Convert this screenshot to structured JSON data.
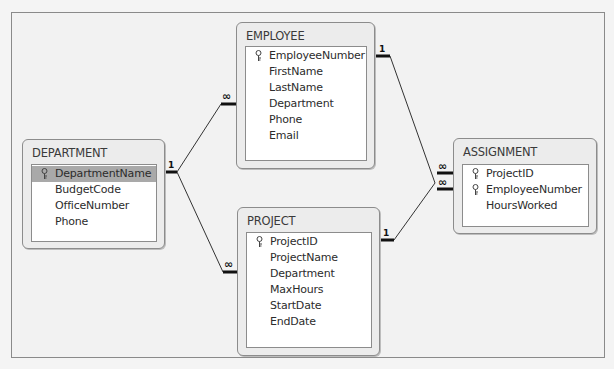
{
  "diagram": {
    "type": "relationships",
    "tables": [
      {
        "id": "department",
        "name": "DEPARTMENT",
        "fields": [
          {
            "name": "DepartmentName",
            "primary_key": true,
            "selected": true
          },
          {
            "name": "BudgetCode",
            "primary_key": false
          },
          {
            "name": "OfficeNumber",
            "primary_key": false
          },
          {
            "name": "Phone",
            "primary_key": false
          }
        ]
      },
      {
        "id": "employee",
        "name": "EMPLOYEE",
        "fields": [
          {
            "name": "EmployeeNumber",
            "primary_key": true
          },
          {
            "name": "FirstName",
            "primary_key": false
          },
          {
            "name": "LastName",
            "primary_key": false
          },
          {
            "name": "Department",
            "primary_key": false
          },
          {
            "name": "Phone",
            "primary_key": false
          },
          {
            "name": "Email",
            "primary_key": false
          }
        ]
      },
      {
        "id": "project",
        "name": "PROJECT",
        "fields": [
          {
            "name": "ProjectID",
            "primary_key": true
          },
          {
            "name": "ProjectName",
            "primary_key": false
          },
          {
            "name": "Department",
            "primary_key": false
          },
          {
            "name": "MaxHours",
            "primary_key": false
          },
          {
            "name": "StartDate",
            "primary_key": false
          },
          {
            "name": "EndDate",
            "primary_key": false
          }
        ]
      },
      {
        "id": "assignment",
        "name": "ASSIGNMENT",
        "fields": [
          {
            "name": "ProjectID",
            "primary_key": true
          },
          {
            "name": "EmployeeNumber",
            "primary_key": true
          },
          {
            "name": "HoursWorked",
            "primary_key": false
          }
        ]
      }
    ],
    "relationships": [
      {
        "from": "DEPARTMENT.DepartmentName",
        "to": "EMPLOYEE.Department",
        "from_label": "1",
        "to_label": "∞"
      },
      {
        "from": "DEPARTMENT.DepartmentName",
        "to": "PROJECT.Department",
        "from_label": "1",
        "to_label": "∞"
      },
      {
        "from": "EMPLOYEE.EmployeeNumber",
        "to": "ASSIGNMENT.EmployeeNumber",
        "from_label": "1",
        "to_label": "∞"
      },
      {
        "from": "PROJECT.ProjectID",
        "to": "ASSIGNMENT.ProjectID",
        "from_label": "1",
        "to_label": "∞"
      }
    ],
    "labels": {
      "one": "1",
      "many": "∞"
    }
  }
}
